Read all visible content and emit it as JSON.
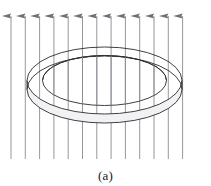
{
  "figure": {
    "title_caption": "(a)",
    "background_color": "#ffffff",
    "field": {
      "line_color": "#8b8b93",
      "arrow_color": "#6f6f77",
      "line_width": 0.9,
      "count": 13,
      "direction": "up",
      "x_positions": [
        11,
        25.3,
        39.6,
        53.9,
        68.2,
        82.5,
        96.8,
        111.1,
        125.4,
        139.7,
        154.0,
        168.3,
        182.6
      ],
      "y_top": 14,
      "y_bottom": 159,
      "arrow_head_width": 5.0,
      "arrow_head_length": 9.0
    },
    "ring": {
      "stroke_color": "#2b2b2b",
      "fill_color": "#fdfdfd",
      "line_width": 0.9,
      "center_x": 104.5,
      "outer_rx": 77.5,
      "outer_ry": 33.5,
      "outer_top_cy": 80.5,
      "inner_rx": 62.0,
      "inner_ry": 25.0,
      "band_offset_y": 9.0,
      "shade_color": "#ededf0"
    }
  }
}
